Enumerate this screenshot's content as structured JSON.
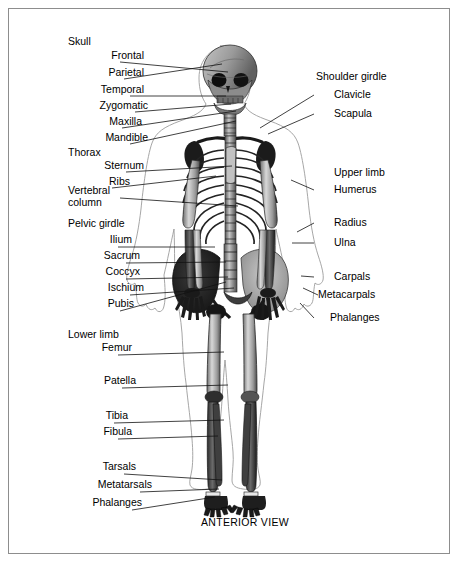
{
  "figure": {
    "caption": "ANTERIOR VIEW",
    "border_color": "#8d8d8d",
    "background": "#ffffff",
    "ink_color": "#000000"
  },
  "left_column": {
    "groups": [
      {
        "header": "Skull",
        "items": [
          {
            "label": "Frontal",
            "x": 148,
            "y": 62,
            "tx": 228,
            "ty": 72
          },
          {
            "label": "Parietal",
            "x": 148,
            "y": 79,
            "tx": 222,
            "ty": 64
          },
          {
            "label": "Temporal",
            "x": 148,
            "y": 96,
            "tx": 226,
            "ty": 96
          },
          {
            "label": "Zygomatic",
            "x": 148,
            "y": 112,
            "tx": 231,
            "ty": 104
          },
          {
            "label": "Maxilla",
            "x": 148,
            "y": 128,
            "tx": 236,
            "ty": 111
          },
          {
            "label": "Mandible",
            "x": 148,
            "y": 144,
            "tx": 236,
            "ty": 121
          }
        ]
      },
      {
        "header": "Thorax",
        "items": [
          {
            "label": "Sternum",
            "x": 148,
            "y": 172,
            "tx": 232,
            "ty": 166
          },
          {
            "label": "Ribs",
            "x": 148,
            "y": 188,
            "tx": 216,
            "ty": 176
          }
        ]
      },
      {
        "header": "Vertebral column",
        "two_line": true,
        "items": [
          {
            "label": "",
            "x": 148,
            "y": 222,
            "tx": 238,
            "ty": 206
          }
        ]
      },
      {
        "header": "Pelvic girdle",
        "items": [
          {
            "label": "Ilium",
            "x": 148,
            "y": 247,
            "tx": 215,
            "ty": 247
          },
          {
            "label": "Sacrum",
            "x": 148,
            "y": 263,
            "tx": 226,
            "ty": 262
          },
          {
            "label": "Coccyx",
            "x": 148,
            "y": 279,
            "tx": 228,
            "ty": 277
          },
          {
            "label": "Ischium",
            "x": 148,
            "y": 295,
            "tx": 234,
            "ty": 288
          },
          {
            "label": "Pubis",
            "x": 148,
            "y": 311,
            "tx": 226,
            "ty": 282
          }
        ]
      },
      {
        "header": "Lower limb",
        "items": [
          {
            "label": "Femur",
            "x": 148,
            "y": 355,
            "tx": 224,
            "ty": 352
          },
          {
            "label": "Patella",
            "x": 148,
            "y": 388,
            "tx": 228,
            "ty": 385
          },
          {
            "label": "Tibia",
            "x": 148,
            "y": 423,
            "tx": 224,
            "ty": 420
          },
          {
            "label": "Fibula",
            "x": 148,
            "y": 439,
            "tx": 218,
            "ty": 436
          },
          {
            "label": "Tarsals",
            "x": 148,
            "y": 474,
            "tx": 222,
            "ty": 480
          },
          {
            "label": "Metatarsals",
            "x": 148,
            "y": 492,
            "tx": 219,
            "ty": 489
          },
          {
            "label": "Phalanges",
            "x": 148,
            "y": 510,
            "tx": 215,
            "ty": 497
          }
        ]
      }
    ]
  },
  "right_column": {
    "groups": [
      {
        "header": "Shoulder girdle",
        "items": [
          {
            "label": "Clavicle",
            "x": 334,
            "y": 95,
            "tx": 260,
            "ty": 128
          },
          {
            "label": "Scapula",
            "x": 334,
            "y": 114,
            "tx": 268,
            "ty": 134
          }
        ]
      },
      {
        "header": "Upper limb",
        "items": [
          {
            "label": "Humerus",
            "x": 334,
            "y": 190,
            "tx": 291,
            "ty": 180
          }
        ]
      },
      {
        "header": "",
        "items": [
          {
            "label": "Radius",
            "x": 334,
            "y": 223,
            "tx": 297,
            "ty": 232
          },
          {
            "label": "Ulna",
            "x": 334,
            "y": 243,
            "tx": 292,
            "ty": 243
          },
          {
            "label": "Carpals",
            "x": 334,
            "y": 277,
            "tx": 301,
            "ty": 276
          },
          {
            "label": "Metacarpals",
            "x": 334,
            "y": 295,
            "tx": 303,
            "ty": 288
          },
          {
            "label": "Phalanges",
            "x": 334,
            "y": 318,
            "tx": 300,
            "ty": 303
          }
        ]
      }
    ]
  },
  "headers": {
    "skull": {
      "text": "Skull",
      "x": 68,
      "y": 41
    },
    "thorax": {
      "text": "Thorax",
      "x": 68,
      "y": 152
    },
    "vertebral_1": {
      "text": "Vertebral",
      "x": 68,
      "y": 186
    },
    "vertebral_2": {
      "text": "column",
      "x": 68,
      "y": 198
    },
    "pelvic": {
      "text": "Pelvic girdle",
      "x": 68,
      "y": 222
    },
    "lower_limb": {
      "text": "Lower limb",
      "x": 68,
      "y": 333
    },
    "shoulder_girdle": {
      "text": "Shoulder girdle",
      "x": 316,
      "y": 76
    },
    "upper_limb": {
      "text": "Upper limb",
      "x": 334,
      "y": 172
    }
  },
  "caption_pos": {
    "x": 201,
    "y": 522
  }
}
